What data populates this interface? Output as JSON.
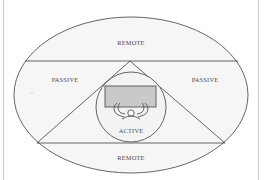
{
  "diagram": {
    "zones": {
      "remote_top": "REMOTE",
      "passive_left": "PASSIVE",
      "passive_right": "PASSIVE",
      "active": "ACTIVE",
      "remote_bottom": "REMOTE"
    },
    "icons": {
      "workstation": "person-at-desk-icon"
    },
    "colors": {
      "background": "#ffffff",
      "ellipse_fill": "#f5f5f5",
      "lines": "#555555",
      "desk": "#c8c8c8",
      "label": "#4a4a4a"
    }
  }
}
